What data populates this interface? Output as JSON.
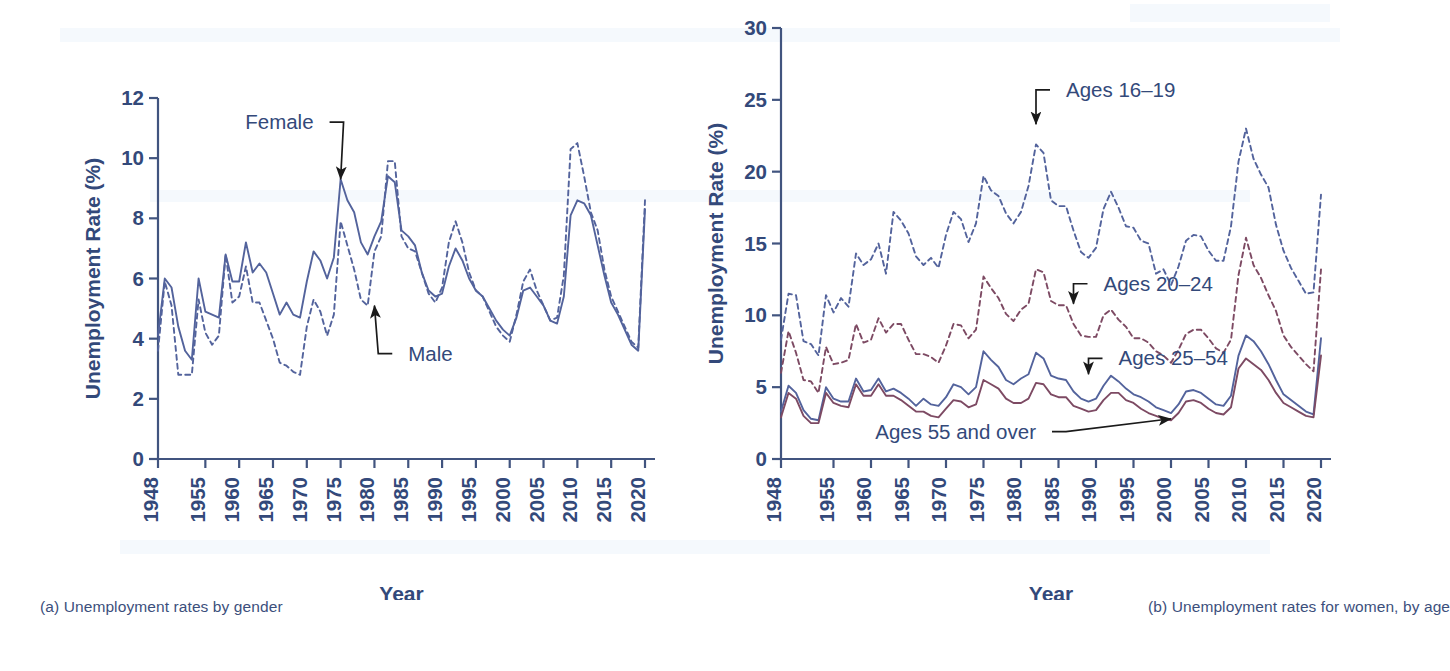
{
  "figure": {
    "panels": [
      {
        "id": "a",
        "caption": "(a) Unemployment rates by gender"
      },
      {
        "id": "b",
        "caption": "(b) Unemployment rates for women, by age"
      }
    ]
  },
  "colors": {
    "axis": "#41547f",
    "tick_text": "#33497a",
    "caption_text": "#3c4f7c",
    "series_blue": "#53639c",
    "series_maroon": "#7d4a63",
    "annotation_text": "#33497a",
    "arrow": "#1a1a1a",
    "background": "#ffffff"
  },
  "chart_data": [
    {
      "id": "a",
      "type": "line",
      "title": "(a) Unemployment rates by gender",
      "xlabel": "Year",
      "ylabel": "Unemployment Rate (%)",
      "xlim": [
        1948,
        2020
      ],
      "ylim": [
        0,
        12
      ],
      "yticks": [
        0,
        2,
        4,
        6,
        8,
        10,
        12
      ],
      "xticks": [
        1948,
        1955,
        1960,
        1965,
        1970,
        1975,
        1980,
        1985,
        1990,
        1995,
        2000,
        2005,
        2010,
        2015,
        2020
      ],
      "grid": false,
      "legend": "annotations",
      "annotations": [
        {
          "text": "Female",
          "x": 1975,
          "y": 9.3,
          "label_x": 1971,
          "label_y": 11.2
        },
        {
          "text": "Male",
          "x": 1980,
          "y": 5.1,
          "label_x": 1985,
          "label_y": 3.5
        }
      ],
      "x": [
        1948,
        1949,
        1950,
        1951,
        1952,
        1953,
        1954,
        1955,
        1956,
        1957,
        1958,
        1959,
        1960,
        1961,
        1962,
        1963,
        1964,
        1965,
        1966,
        1967,
        1968,
        1969,
        1970,
        1971,
        1972,
        1973,
        1974,
        1975,
        1976,
        1977,
        1978,
        1979,
        1980,
        1981,
        1982,
        1983,
        1984,
        1985,
        1986,
        1987,
        1988,
        1989,
        1990,
        1991,
        1992,
        1993,
        1994,
        1995,
        1996,
        1997,
        1998,
        1999,
        2000,
        2001,
        2002,
        2003,
        2004,
        2005,
        2006,
        2007,
        2008,
        2009,
        2010,
        2011,
        2012,
        2013,
        2014,
        2015,
        2016,
        2017,
        2018,
        2019,
        2020
      ],
      "series": [
        {
          "name": "Female",
          "style": "solid",
          "color": "#53639c",
          "values": [
            4.1,
            6.0,
            5.7,
            4.4,
            3.6,
            3.3,
            6.0,
            4.9,
            4.8,
            4.7,
            6.8,
            5.9,
            5.9,
            7.2,
            6.2,
            6.5,
            6.2,
            5.5,
            4.8,
            5.2,
            4.8,
            4.7,
            5.9,
            6.9,
            6.6,
            6.0,
            6.7,
            9.3,
            8.6,
            8.2,
            7.2,
            6.8,
            7.4,
            7.9,
            9.4,
            9.2,
            7.6,
            7.4,
            7.1,
            6.2,
            5.6,
            5.4,
            5.5,
            6.4,
            7.0,
            6.6,
            6.0,
            5.6,
            5.4,
            5.0,
            4.6,
            4.3,
            4.1,
            4.7,
            5.6,
            5.7,
            5.4,
            5.1,
            4.6,
            4.5,
            5.4,
            8.1,
            8.6,
            8.5,
            8.1,
            7.1,
            6.1,
            5.2,
            4.8,
            4.3,
            3.8,
            3.6,
            8.3
          ]
        },
        {
          "name": "Male",
          "style": "dashed",
          "color": "#53639c",
          "values": [
            3.6,
            5.9,
            5.1,
            2.8,
            2.8,
            2.8,
            5.3,
            4.2,
            3.8,
            4.1,
            6.8,
            5.2,
            5.4,
            6.4,
            5.2,
            5.2,
            4.6,
            4.0,
            3.2,
            3.1,
            2.9,
            2.8,
            4.4,
            5.3,
            4.9,
            4.1,
            4.8,
            7.9,
            7.1,
            6.3,
            5.3,
            5.1,
            6.9,
            7.4,
            9.9,
            9.9,
            7.4,
            7.0,
            6.9,
            6.2,
            5.5,
            5.2,
            5.7,
            7.2,
            7.9,
            7.2,
            6.2,
            5.6,
            5.4,
            4.9,
            4.4,
            4.1,
            3.9,
            4.8,
            5.9,
            6.3,
            5.6,
            5.1,
            4.6,
            4.7,
            6.1,
            10.3,
            10.5,
            9.4,
            8.2,
            7.6,
            6.3,
            5.4,
            4.9,
            4.4,
            3.9,
            3.7,
            8.6
          ]
        }
      ]
    },
    {
      "id": "b",
      "type": "line",
      "title": "(b) Unemployment rates for women, by age",
      "xlabel": "Year",
      "ylabel": "Unemployment Rate (%)",
      "xlim": [
        1948,
        2020
      ],
      "ylim": [
        0,
        30
      ],
      "yticks": [
        0,
        5,
        10,
        15,
        20,
        25,
        30
      ],
      "xticks": [
        1948,
        1955,
        1960,
        1965,
        1970,
        1975,
        1980,
        1985,
        1990,
        1995,
        2000,
        2005,
        2010,
        2015,
        2020
      ],
      "grid": false,
      "legend": "annotations",
      "annotations": [
        {
          "text": "Ages 16–19",
          "x": 1982,
          "y": 23.3,
          "label_x": 1986,
          "label_y": 25.7
        },
        {
          "text": "Ages 20–24",
          "x": 1987,
          "y": 10.8,
          "label_x": 1991,
          "label_y": 12.2
        },
        {
          "text": "Ages 25–54",
          "x": 1989,
          "y": 5.9,
          "label_x": 1993,
          "label_y": 7.0
        },
        {
          "text": "Ages 55 and over",
          "x": 2000,
          "y": 2.8,
          "label_x": 1982,
          "label_y": 1.9
        }
      ],
      "x": [
        1948,
        1949,
        1950,
        1951,
        1952,
        1953,
        1954,
        1955,
        1956,
        1957,
        1958,
        1959,
        1960,
        1961,
        1962,
        1963,
        1964,
        1965,
        1966,
        1967,
        1968,
        1969,
        1970,
        1971,
        1972,
        1973,
        1974,
        1975,
        1976,
        1977,
        1978,
        1979,
        1980,
        1981,
        1982,
        1983,
        1984,
        1985,
        1986,
        1987,
        1988,
        1989,
        1990,
        1991,
        1992,
        1993,
        1994,
        1995,
        1996,
        1997,
        1998,
        1999,
        2000,
        2001,
        2002,
        2003,
        2004,
        2005,
        2006,
        2007,
        2008,
        2009,
        2010,
        2011,
        2012,
        2013,
        2014,
        2015,
        2016,
        2017,
        2018,
        2019,
        2020
      ],
      "series": [
        {
          "name": "Ages 16–19",
          "style": "dashed",
          "color": "#53639c",
          "values": [
            8.3,
            11.5,
            11.4,
            8.2,
            8.0,
            7.2,
            11.4,
            10.2,
            11.2,
            10.6,
            14.3,
            13.5,
            13.9,
            15.0,
            12.9,
            17.2,
            16.6,
            15.7,
            14.1,
            13.5,
            14.0,
            13.3,
            15.6,
            17.2,
            16.7,
            15.1,
            16.4,
            19.7,
            18.7,
            18.3,
            17.1,
            16.4,
            17.2,
            19.0,
            21.9,
            21.3,
            18.0,
            17.6,
            17.6,
            15.9,
            14.4,
            14.0,
            14.7,
            17.4,
            18.6,
            17.5,
            16.2,
            16.1,
            15.2,
            15.0,
            12.9,
            13.2,
            12.1,
            13.4,
            15.2,
            15.6,
            15.5,
            14.5,
            13.8,
            13.8,
            16.2,
            20.7,
            23.0,
            20.9,
            19.8,
            18.9,
            16.3,
            14.5,
            13.3,
            12.4,
            11.5,
            11.6,
            18.4
          ]
        },
        {
          "name": "Ages 20–24",
          "style": "dashed",
          "color": "#7d4a63",
          "values": [
            6.0,
            8.9,
            7.4,
            5.5,
            5.4,
            4.6,
            7.8,
            6.6,
            6.7,
            6.9,
            9.4,
            8.1,
            8.3,
            9.8,
            8.8,
            9.4,
            9.4,
            8.3,
            7.3,
            7.3,
            7.1,
            6.7,
            7.9,
            9.4,
            9.3,
            8.4,
            9.0,
            12.7,
            11.9,
            11.2,
            10.1,
            9.6,
            10.4,
            10.8,
            13.2,
            13.0,
            11.0,
            10.7,
            10.7,
            9.4,
            8.6,
            8.5,
            8.5,
            10.0,
            10.4,
            9.7,
            9.2,
            8.4,
            8.4,
            8.1,
            7.5,
            7.2,
            6.7,
            7.6,
            8.7,
            9.0,
            9.0,
            8.4,
            7.7,
            7.4,
            8.3,
            12.8,
            15.4,
            13.5,
            12.6,
            11.4,
            10.3,
            8.6,
            7.8,
            7.2,
            6.6,
            6.1,
            13.2
          ]
        },
        {
          "name": "Ages 25–54",
          "style": "solid",
          "color": "#53639c",
          "values": [
            3.3,
            5.1,
            4.6,
            3.4,
            2.8,
            2.7,
            5.0,
            4.2,
            4.0,
            4.0,
            5.6,
            4.7,
            4.8,
            5.6,
            4.7,
            4.9,
            4.6,
            4.2,
            3.7,
            4.2,
            3.8,
            3.7,
            4.3,
            5.2,
            5.0,
            4.5,
            5.0,
            7.5,
            6.9,
            6.4,
            5.5,
            5.2,
            5.6,
            5.9,
            7.4,
            7.0,
            5.8,
            5.6,
            5.5,
            4.7,
            4.2,
            4.0,
            4.2,
            5.1,
            5.8,
            5.4,
            4.9,
            4.5,
            4.3,
            4.0,
            3.6,
            3.4,
            3.2,
            3.8,
            4.7,
            4.8,
            4.6,
            4.2,
            3.8,
            3.7,
            4.4,
            7.2,
            8.6,
            8.2,
            7.5,
            6.6,
            5.5,
            4.5,
            4.1,
            3.7,
            3.3,
            3.1,
            8.4
          ]
        },
        {
          "name": "Ages 55 and over",
          "style": "solid",
          "color": "#7d4a63",
          "values": [
            2.9,
            4.6,
            4.2,
            3.0,
            2.5,
            2.5,
            4.6,
            3.9,
            3.7,
            3.6,
            5.2,
            4.4,
            4.4,
            5.2,
            4.4,
            4.4,
            4.1,
            3.7,
            3.3,
            3.3,
            3.0,
            2.9,
            3.5,
            4.1,
            4.0,
            3.6,
            3.8,
            5.5,
            5.2,
            4.9,
            4.2,
            3.9,
            3.9,
            4.2,
            5.3,
            5.2,
            4.5,
            4.3,
            4.3,
            3.7,
            3.5,
            3.3,
            3.4,
            4.1,
            4.6,
            4.6,
            4.1,
            3.9,
            3.5,
            3.2,
            3.0,
            2.8,
            2.7,
            3.2,
            4.0,
            4.1,
            3.9,
            3.5,
            3.2,
            3.1,
            3.6,
            6.3,
            7.0,
            6.6,
            6.2,
            5.5,
            4.6,
            3.9,
            3.6,
            3.3,
            3.0,
            2.9,
            7.2
          ]
        }
      ]
    }
  ]
}
